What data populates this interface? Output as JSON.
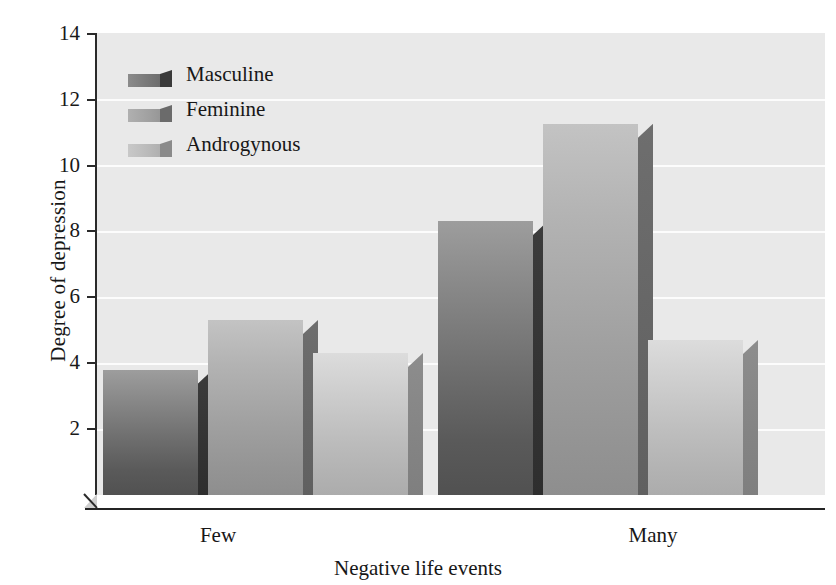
{
  "chart_data": {
    "type": "bar",
    "title": "",
    "xlabel": "Negative life events",
    "ylabel": "Degree of depression",
    "categories": [
      "Few",
      "Many"
    ],
    "series": [
      {
        "name": "Masculine",
        "values": [
          3.8,
          8.3
        ]
      },
      {
        "name": "Feminine",
        "values": [
          5.3,
          11.25
        ]
      },
      {
        "name": "Androgynous",
        "values": [
          4.3,
          4.7
        ]
      }
    ],
    "ylim": [
      0,
      14
    ],
    "yticks": [
      0,
      2,
      4,
      6,
      8,
      10,
      12,
      14
    ],
    "ytick_labels": [
      "",
      "2",
      "4",
      "6",
      "8",
      "10",
      "12",
      "14"
    ],
    "grid": true,
    "legend_position": "upper-left",
    "style": "3d-bars-grayscale",
    "colors": {
      "masculine": "#6e6e6e",
      "feminine": "#a0a0a0",
      "androgynous": "#bdbdbd",
      "plot_background": "#e9e9e9",
      "gridline": "#ffffff",
      "axis": "#242424",
      "text": "#171717"
    }
  },
  "axes": {
    "y_title": "Degree of depression",
    "x_title": "Negative life events",
    "y_ticks": [
      {
        "value": 14,
        "label": "14"
      },
      {
        "value": 12,
        "label": "12"
      },
      {
        "value": 10,
        "label": "10"
      },
      {
        "value": 8,
        "label": "8"
      },
      {
        "value": 6,
        "label": "6"
      },
      {
        "value": 4,
        "label": "4"
      },
      {
        "value": 2,
        "label": "2"
      }
    ],
    "x_categories": [
      {
        "label": "Few"
      },
      {
        "label": "Many"
      }
    ]
  },
  "legend": {
    "items": [
      {
        "label": "Masculine"
      },
      {
        "label": "Feminine"
      },
      {
        "label": "Androgynous"
      }
    ]
  }
}
